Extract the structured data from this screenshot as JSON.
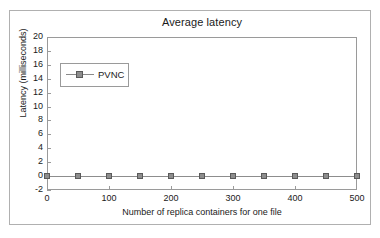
{
  "chart_data": {
    "type": "line",
    "title": "Average latency",
    "xlabel": "Number of replica containers for one file",
    "ylabel": "Latency (milliseconds)",
    "xlim": [
      0,
      500
    ],
    "ylim": [
      -2,
      20
    ],
    "x_ticks": [
      0,
      100,
      200,
      300,
      400,
      500
    ],
    "x_tick_labels": [
      "0",
      "100",
      "200",
      "300",
      "400",
      "500"
    ],
    "y_ticks": [
      -2,
      0,
      2,
      4,
      6,
      8,
      10,
      12,
      14,
      16,
      18,
      20
    ],
    "y_tick_labels": [
      "-2",
      "0",
      "2",
      "4",
      "6",
      "8",
      "10",
      "12",
      "14",
      "16",
      "18",
      "20"
    ],
    "grid": false,
    "legend_position": "upper-left-inside",
    "legend": [
      "PVNC"
    ],
    "x": [
      0,
      50,
      100,
      150,
      200,
      250,
      300,
      350,
      400,
      450,
      500
    ],
    "series": [
      {
        "name": "PVNC",
        "marker": "square",
        "color": "#8d8d8d",
        "values": [
          0,
          0,
          0,
          0,
          0,
          0,
          0,
          0,
          0,
          0,
          0
        ]
      }
    ]
  },
  "colors": {
    "series": "#8d8d8d",
    "series_edge": "#5a5a5a",
    "axis": "#9a9a9a",
    "frame": "#b0b0b0",
    "text": "#1a1a1a",
    "background": "#ffffff"
  }
}
